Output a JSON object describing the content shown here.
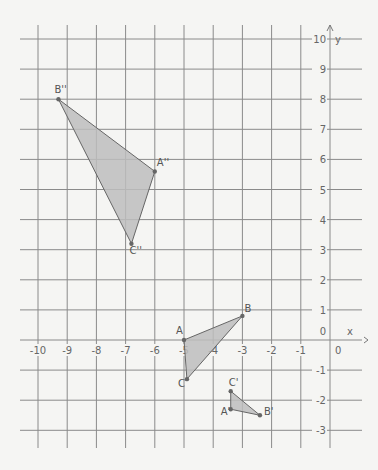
{
  "diagram": {
    "type": "coordinate-plane",
    "x_range": [
      -10,
      0
    ],
    "y_range": [
      -3,
      10
    ],
    "axis_labels": {
      "x": "x",
      "y": "y"
    },
    "x_ticks": [
      "-10",
      "-9",
      "-8",
      "-7",
      "-6",
      "-5",
      "-4",
      "-3",
      "-2",
      "-1",
      "0"
    ],
    "y_ticks": [
      "10",
      "9",
      "8",
      "7",
      "6",
      "5",
      "4",
      "3",
      "2",
      "1",
      "0",
      "-1",
      "-2",
      "-3"
    ],
    "origin_label": "0",
    "colors": {
      "fill": "#bdbdbd",
      "stroke": "#666666",
      "grid": "#8a8a8a",
      "background": "#f5f5f3"
    },
    "triangles": [
      {
        "name": "ABC",
        "vertices": [
          {
            "label": "A",
            "x": -5.0,
            "y": 0.0
          },
          {
            "label": "B",
            "x": -3.0,
            "y": 0.8
          },
          {
            "label": "C",
            "x": -4.9,
            "y": -1.3
          }
        ]
      },
      {
        "name": "A'B'C'",
        "vertices": [
          {
            "label": "A'",
            "x": -3.4,
            "y": -2.3
          },
          {
            "label": "B'",
            "x": -2.4,
            "y": -2.5
          },
          {
            "label": "C'",
            "x": -3.4,
            "y": -1.7
          }
        ]
      },
      {
        "name": "A''B''C''",
        "vertices": [
          {
            "label": "A''",
            "x": -6.0,
            "y": 5.6
          },
          {
            "label": "B''",
            "x": -9.3,
            "y": 8.0
          },
          {
            "label": "C''",
            "x": -6.8,
            "y": 3.2
          }
        ]
      }
    ]
  }
}
